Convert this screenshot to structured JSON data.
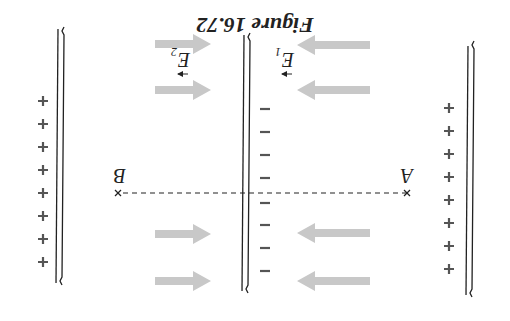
{
  "figure": {
    "title": "Figure 16.72",
    "orientation": "rotated 180 degrees",
    "labels": {
      "point_a": "A",
      "point_b": "B",
      "field_1": "E",
      "field_1_sub": "1",
      "field_2": "E",
      "field_2_sub": "2"
    },
    "plates": [
      {
        "name": "left-plate",
        "charge": "+",
        "count": 8
      },
      {
        "name": "middle-plate",
        "charge": "−",
        "count": 8
      },
      {
        "name": "right-plate",
        "charge": "+",
        "count": 8
      }
    ],
    "colors": {
      "arrow": "#c8c8c8",
      "line": "#222222",
      "charge": "#555555"
    }
  }
}
